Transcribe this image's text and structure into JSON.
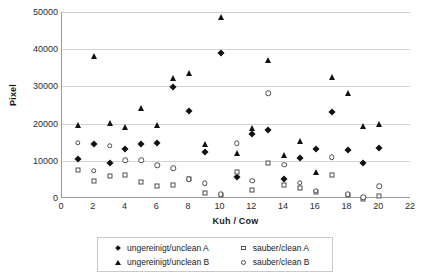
{
  "chart_data": {
    "type": "scatter",
    "title": "",
    "xlabel": "Kuh / Cow",
    "ylabel": "Pixel",
    "xlim": [
      0,
      22
    ],
    "ylim": [
      0,
      50000
    ],
    "xticks": [
      0,
      2,
      4,
      6,
      8,
      10,
      12,
      14,
      16,
      18,
      20,
      22
    ],
    "yticks": [
      0,
      10000,
      20000,
      30000,
      40000,
      50000
    ],
    "grid": "horizontal",
    "legend_position": "bottom",
    "x": [
      1,
      2,
      3,
      4,
      5,
      6,
      7,
      8,
      9,
      10,
      11,
      12,
      13,
      14,
      15,
      16,
      17,
      18,
      19,
      20
    ],
    "series": [
      {
        "name": "ungereinigt/unclean A",
        "marker": "filled-diamond",
        "color": "#111111",
        "values": [
          10500,
          14400,
          9400,
          13300,
          14600,
          14900,
          29800,
          23500,
          12300,
          39000,
          5700,
          17100,
          18300,
          5200,
          10700,
          13200,
          23100,
          12900,
          9300,
          13400
        ]
      },
      {
        "name": "ungereinigt/unclean B",
        "marker": "filled-triangle",
        "color": "#111111",
        "values": [
          19700,
          38300,
          20100,
          19100,
          24100,
          19700,
          32300,
          33700,
          14600,
          48700,
          12100,
          18900,
          37100,
          11500,
          15400,
          7000,
          32500,
          28300,
          19300,
          20000
        ]
      },
      {
        "name": "sauber/clean A",
        "marker": "open-square",
        "color": "#4d4d4d",
        "values": [
          7400,
          4700,
          6000,
          6300,
          4300,
          3100,
          3600,
          5000,
          1300,
          900,
          7000,
          2200,
          9300,
          3400,
          2600,
          1600,
          6200,
          800,
          -300,
          600
        ]
      },
      {
        "name": "sauber/clean B",
        "marker": "open-circle",
        "color": "#4d4d4d",
        "values": [
          14900,
          7300,
          14000,
          10200,
          10100,
          8800,
          8000,
          5000,
          4000,
          1000,
          14700,
          4700,
          28100,
          9000,
          4100,
          2000,
          11000,
          1000,
          200,
          3100
        ]
      }
    ]
  },
  "legend": {
    "entries": [
      {
        "label": "ungereinigt/unclean A",
        "marker": "filled-diamond"
      },
      {
        "label": "sauber/clean A",
        "marker": "open-square"
      },
      {
        "label": "ungereinigt/unclean B",
        "marker": "filled-triangle"
      },
      {
        "label": "sauber/clean B",
        "marker": "open-circle"
      }
    ]
  }
}
